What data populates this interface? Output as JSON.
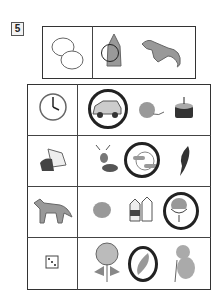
{
  "exercise": {
    "number": "5",
    "example": {
      "given": "potatoes",
      "options": [
        {
          "name": "artichoke",
          "circled": true
        },
        {
          "name": "ferret",
          "circled": false
        }
      ]
    }
  },
  "rows": [
    {
      "given": "clock",
      "clock_time": "4:00",
      "options": [
        {
          "name": "car",
          "circled": true
        },
        {
          "name": "ball-of-yarn",
          "circled": false
        },
        {
          "name": "birthday-cake",
          "circled": false
        }
      ]
    },
    {
      "given": "hermit-crab",
      "options": [
        {
          "name": "praying-mantis",
          "circled": false
        },
        {
          "name": "moon-with-clouds",
          "circled": true
        },
        {
          "name": "feather-quill",
          "circled": false
        }
      ]
    },
    {
      "given": "fox",
      "options": [
        {
          "name": "orange",
          "circled": false
        },
        {
          "name": "milk-cartons",
          "circled": false
        },
        {
          "name": "ice-cream-sundae",
          "circled": true
        }
      ]
    },
    {
      "given": "dice",
      "options": [
        {
          "name": "hydrangea",
          "circled": false
        },
        {
          "name": "feather",
          "circled": true
        },
        {
          "name": "koala",
          "circled": false
        }
      ]
    }
  ],
  "colors": {
    "line": "#333333",
    "circle": "#222222",
    "fill": "#9a9a9a"
  }
}
